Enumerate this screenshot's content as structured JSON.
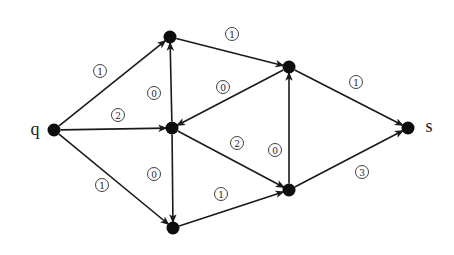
{
  "diagram": {
    "type": "directed-weighted-graph",
    "colors": {
      "edge": "#1a1a1a",
      "node": "#0d0d0d",
      "label": "#222222",
      "background": "#ffffff"
    },
    "nodes": [
      {
        "id": "q",
        "label": "q",
        "x": 54,
        "y": 130,
        "label_x": 35,
        "label_y": 129
      },
      {
        "id": "a",
        "label": "",
        "x": 170,
        "y": 37
      },
      {
        "id": "b",
        "label": "",
        "x": 172,
        "y": 128
      },
      {
        "id": "c",
        "label": "",
        "x": 173,
        "y": 228
      },
      {
        "id": "d",
        "label": "",
        "x": 289,
        "y": 67
      },
      {
        "id": "e",
        "label": "",
        "x": 289,
        "y": 190
      },
      {
        "id": "s",
        "label": "s",
        "x": 408,
        "y": 128,
        "label_x": 429,
        "label_y": 126
      }
    ],
    "edges": [
      {
        "from": "q",
        "to": "a",
        "weight": "1",
        "label_x": 100,
        "label_y": 71
      },
      {
        "from": "q",
        "to": "b",
        "weight": "2",
        "label_x": 118,
        "label_y": 115
      },
      {
        "from": "q",
        "to": "c",
        "weight": "1",
        "label_x": 102,
        "label_y": 185
      },
      {
        "from": "b",
        "to": "a",
        "weight": "0",
        "label_x": 154,
        "label_y": 93
      },
      {
        "from": "b",
        "to": "c",
        "weight": "0",
        "label_x": 154,
        "label_y": 174
      },
      {
        "from": "a",
        "to": "d",
        "weight": "1",
        "label_x": 232,
        "label_y": 34
      },
      {
        "from": "d",
        "to": "b",
        "weight": "0",
        "label_x": 223,
        "label_y": 87
      },
      {
        "from": "b",
        "to": "e",
        "weight": "2",
        "label_x": 237,
        "label_y": 143
      },
      {
        "from": "c",
        "to": "e",
        "weight": "1",
        "label_x": 221,
        "label_y": 194
      },
      {
        "from": "e",
        "to": "d",
        "weight": "0",
        "label_x": 275,
        "label_y": 150
      },
      {
        "from": "d",
        "to": "s",
        "weight": "1",
        "label_x": 356,
        "label_y": 82
      },
      {
        "from": "e",
        "to": "s",
        "weight": "3",
        "label_x": 362,
        "label_y": 172
      }
    ]
  }
}
